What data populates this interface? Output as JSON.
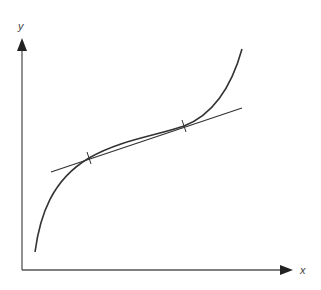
{
  "diagram": {
    "type": "function-with-tangent-line",
    "axes": {
      "x_label": "x",
      "y_label": "y",
      "origin": [
        22,
        270
      ],
      "x_end": [
        291,
        270
      ],
      "y_end": [
        22,
        40
      ]
    },
    "curve": {
      "start": [
        35,
        252
      ],
      "end": [
        242,
        49
      ],
      "color": "#333333"
    },
    "line": {
      "start": [
        51,
        172
      ],
      "end": [
        242,
        108
      ],
      "color": "#333333"
    },
    "intersections": [
      {
        "x": 89,
        "y": 158
      },
      {
        "x": 184,
        "y": 126
      }
    ],
    "colors": {
      "axis": "#555555",
      "stroke": "#333333",
      "background": "#ffffff"
    }
  }
}
